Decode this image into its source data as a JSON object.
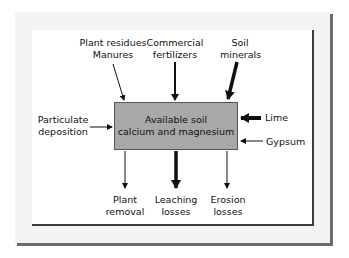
{
  "diagram": {
    "center_box": {
      "line1": "Available soil",
      "line2": "calcium and magnesium",
      "fill": "#a8a8a8"
    },
    "inputs_top": [
      {
        "line1": "Plant residues",
        "line2": "Manures",
        "arrow": "thin"
      },
      {
        "line1": "Commercial",
        "line2": "fertilizers",
        "arrow": "medium"
      },
      {
        "line1": "Soil",
        "line2": "minerals",
        "arrow": "thick"
      }
    ],
    "inputs_left": [
      {
        "line1": "Particulate",
        "line2": "deposition",
        "arrow": "thin"
      }
    ],
    "inputs_right": [
      {
        "label": "Lime",
        "arrow": "thick"
      },
      {
        "label": "Gypsum",
        "arrow": "thin"
      }
    ],
    "outputs_bottom": [
      {
        "line1": "Plant",
        "line2": "removal",
        "arrow": "thin"
      },
      {
        "line1": "Leaching",
        "line2": "losses",
        "arrow": "thick"
      },
      {
        "line1": "Erosion",
        "line2": "losses",
        "arrow": "thin"
      }
    ]
  }
}
